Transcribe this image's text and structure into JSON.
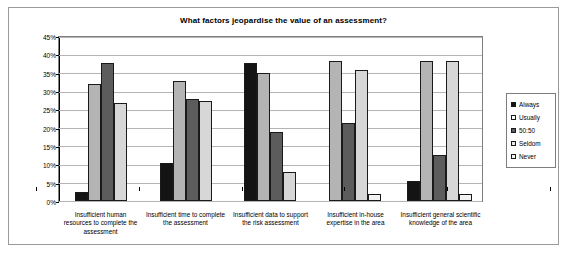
{
  "chart_data": {
    "type": "bar",
    "title": "What factors jeopardise the value of an assessment?",
    "xlabel": "",
    "ylabel": "",
    "ylim": [
      0,
      45
    ],
    "ytick_labels": [
      "0%",
      "5%",
      "10%",
      "15%",
      "20%",
      "25%",
      "30%",
      "35%",
      "40%",
      "45%"
    ],
    "ytick_values": [
      0,
      5,
      10,
      15,
      20,
      25,
      30,
      35,
      40,
      45
    ],
    "grid": true,
    "legend_position": "right",
    "categories": [
      "Insufficient human resources to complete the assessment",
      "Insufficient time to complete the assessment",
      "Insufficient data to support the risk assessment",
      "Insufficient in-house expertise in the area",
      "Insufficient general scientific knowledge of the area"
    ],
    "series": [
      {
        "name": "Always",
        "values": [
          2.5,
          10.5,
          38.0,
          0.0,
          5.5
        ]
      },
      {
        "name": "Usually",
        "values": [
          32.0,
          33.0,
          35.0,
          38.5,
          38.5
        ]
      },
      {
        "name": "50:50",
        "values": [
          38.0,
          28.0,
          19.0,
          21.5,
          12.5
        ]
      },
      {
        "name": "Seldom",
        "values": [
          27.0,
          27.5,
          8.0,
          36.0,
          38.5
        ]
      },
      {
        "name": "Never",
        "values": [
          0.0,
          0.0,
          0.0,
          2.0,
          2.0
        ]
      }
    ]
  },
  "colors": {
    "always": "#141414",
    "usually": "#b4b4b4",
    "fifty_fifty": "#5c5c5c",
    "seldom": "#d7d7d7",
    "never": "#f2f2f2",
    "frame_border": "#9a9a9a",
    "gridline": "#b4b4b4"
  }
}
